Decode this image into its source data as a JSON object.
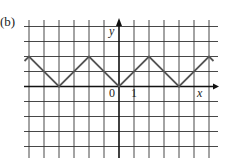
{
  "panel_label": "(b)",
  "colors": {
    "grid": "#333333",
    "axis": "#111111",
    "curve": "#555555",
    "background": "#ffffff"
  },
  "chart_data": {
    "type": "line",
    "title": "(b)",
    "xlabel": "x",
    "ylabel": "y",
    "tick_labels": {
      "origin": "0",
      "x_unit": "1"
    },
    "grid": true,
    "grid_spacing": 1,
    "xlim": [
      -6.3,
      6.4
    ],
    "ylim": [
      -4.8,
      4.4
    ],
    "series": [
      {
        "name": "periodic triangle wave",
        "x": [
          -6.3,
          -6,
          -4,
          -2,
          0,
          2,
          4,
          6,
          6.3
        ],
        "y": [
          1.7,
          2,
          0,
          2,
          0,
          2,
          0,
          2,
          1.7
        ]
      }
    ]
  },
  "labels": {
    "y_axis": "y",
    "x_axis": "x",
    "origin": "0",
    "one": "1"
  }
}
